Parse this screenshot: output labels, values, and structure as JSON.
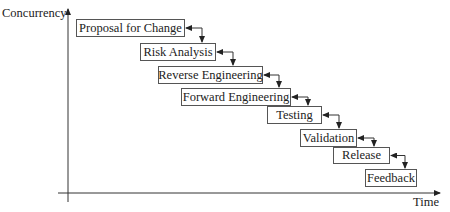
{
  "axes": {
    "y_label": "Concurrency",
    "x_label": "Time"
  },
  "stages": [
    {
      "label": "Proposal for Change",
      "x": 76,
      "y": 19,
      "w": 109,
      "h": 18
    },
    {
      "label": "Risk Analysis",
      "x": 140,
      "y": 43,
      "w": 76,
      "h": 18
    },
    {
      "label": "Reverse Engineering",
      "x": 158,
      "y": 66,
      "w": 105,
      "h": 18
    },
    {
      "label": "Forward Engineering",
      "x": 181,
      "y": 88,
      "w": 110,
      "h": 18
    },
    {
      "label": "Testing",
      "x": 267,
      "y": 106,
      "w": 55,
      "h": 18
    },
    {
      "label": "Validation",
      "x": 300,
      "y": 129,
      "w": 57,
      "h": 18
    },
    {
      "label": "Release",
      "x": 333,
      "y": 147,
      "w": 57,
      "h": 17
    },
    {
      "label": "Feedback",
      "x": 365,
      "y": 169,
      "w": 52,
      "h": 18
    }
  ],
  "colors": {
    "line": "#333333",
    "box_border": "#555555",
    "text": "#222222"
  }
}
